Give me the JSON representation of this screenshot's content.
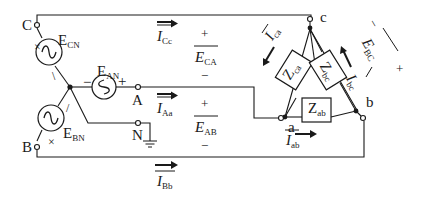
{
  "diagram": {
    "colors": {
      "line": "#1a1a1a",
      "background": "#ffffff"
    },
    "source_terminals": [
      {
        "id": "C",
        "label": "C"
      },
      {
        "id": "A",
        "label": "A"
      },
      {
        "id": "B",
        "label": "B"
      },
      {
        "id": "N",
        "label": "N"
      }
    ],
    "load_terminals": [
      {
        "id": "a",
        "label": "a"
      },
      {
        "id": "b",
        "label": "b"
      },
      {
        "id": "c",
        "label": "c"
      }
    ],
    "sources": {
      "cn": {
        "main": "E",
        "sub": "CN",
        "plus": "+",
        "minus": "\\"
      },
      "an": {
        "main": "E",
        "sub": "AN",
        "plus": "+",
        "minus": "−"
      },
      "bn": {
        "main": "E",
        "sub": "BN",
        "plus": "+",
        "minus": "/"
      }
    },
    "impedances": {
      "ab": {
        "main": "Z",
        "sub": "ab"
      },
      "bc": {
        "main": "Z",
        "sub": "bc"
      },
      "ca": {
        "main": "Z",
        "sub": "ca"
      }
    },
    "line_currents": {
      "cc": {
        "main": "I",
        "sub": "Cc"
      },
      "aa": {
        "main": "I",
        "sub": "Aa"
      },
      "bb": {
        "main": "I",
        "sub": "Bb"
      }
    },
    "phase_currents": {
      "ab": {
        "main": "I",
        "sub": "ab"
      },
      "bc": {
        "main": "I",
        "sub": "bc"
      },
      "ca": {
        "main": "I",
        "sub": "ca"
      }
    },
    "line_voltages": {
      "ca": {
        "main": "E",
        "sub": "CA",
        "plus": "+",
        "minus": "−"
      },
      "ab": {
        "main": "E",
        "sub": "AB",
        "plus": "+",
        "minus": "−"
      },
      "bc": {
        "main": "E",
        "sub": "BC",
        "plus": "+",
        "minus": "−"
      }
    },
    "ground": {
      "label": "ground-symbol"
    }
  }
}
